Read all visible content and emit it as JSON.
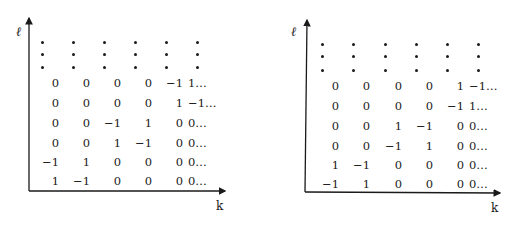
{
  "panels": [
    {
      "id": "left",
      "y_axis_label": "ℓ",
      "x_axis_label": "k",
      "ellipsis_rows": 3,
      "rows": [
        [
          "0",
          "0",
          "0",
          "0",
          "−1",
          "1…"
        ],
        [
          "0",
          "0",
          "0",
          "0",
          "1",
          "−1…"
        ],
        [
          "0",
          "0",
          "−1",
          "1",
          "0",
          "0…"
        ],
        [
          "0",
          "0",
          "1",
          "−1",
          "0",
          "0…"
        ],
        [
          "−1",
          "1",
          "0",
          "0",
          "0",
          "0…"
        ],
        [
          "1",
          "−1",
          "0",
          "0",
          "0",
          "0…"
        ]
      ]
    },
    {
      "id": "right",
      "y_axis_label": "ℓ",
      "x_axis_label": "k",
      "ellipsis_rows": 3,
      "rows": [
        [
          "0",
          "0",
          "0",
          "0",
          "1",
          "−1…"
        ],
        [
          "0",
          "0",
          "0",
          "0",
          "−1",
          "1…"
        ],
        [
          "0",
          "0",
          "1",
          "−1",
          "0",
          "0…"
        ],
        [
          "0",
          "0",
          "−1",
          "1",
          "0",
          "0…"
        ],
        [
          "1",
          "−1",
          "0",
          "0",
          "0",
          "0…"
        ],
        [
          "−1",
          "1",
          "0",
          "0",
          "0",
          "0…"
        ]
      ]
    }
  ]
}
